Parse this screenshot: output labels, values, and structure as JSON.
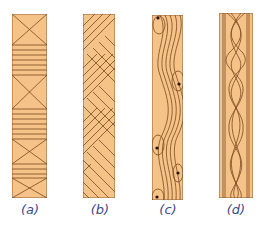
{
  "figure": {
    "colors": {
      "wood": "#f5c287",
      "line": "#7a4a22",
      "knot": "#2a1208",
      "label": "#3a4a8a",
      "background": "#ffffff"
    },
    "panels": [
      {
        "id": "a",
        "label": "(a)",
        "pattern": "alternating X-cross blocks and horizontal stripe bands"
      },
      {
        "id": "b",
        "label": "(b)",
        "pattern": "herringbone diagonal stripes alternating direction"
      },
      {
        "id": "c",
        "label": "(c)",
        "pattern": "wavy wood grain with knots"
      },
      {
        "id": "d",
        "label": "(d)",
        "pattern": "braided interlaced strands between border lines"
      }
    ]
  }
}
